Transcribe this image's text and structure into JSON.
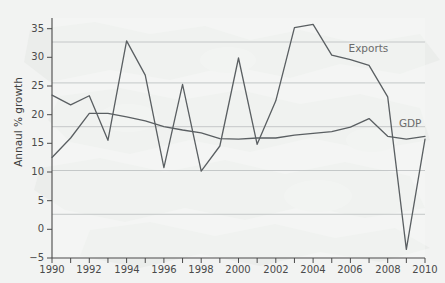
{
  "figure": {
    "background_color": "#f3f4f3",
    "plot_background_color": "#f6f7f6",
    "watermark": "world-map-outline"
  },
  "chart_data": {
    "type": "line",
    "title": "",
    "subtitle": "",
    "xlabel": "",
    "ylabel": "Annaul % growth",
    "xlim": [
      1990,
      2010
    ],
    "ylim": [
      -5,
      37
    ],
    "yticks": [
      -5,
      0,
      5,
      10,
      15,
      20,
      25,
      30,
      35
    ],
    "ytick_labels": [
      "−5",
      "0",
      "5",
      "10",
      "15",
      "20",
      "25",
      "30",
      "35"
    ],
    "xticks": [
      1990,
      1991,
      1992,
      1993,
      1994,
      1995,
      1996,
      1997,
      1998,
      1999,
      2000,
      2001,
      2002,
      2003,
      2004,
      2005,
      2006,
      2007,
      2008,
      2009,
      2010
    ],
    "xtick_labels_shown": [
      "1990",
      "1992",
      "1994",
      "1996",
      "1998",
      "2000",
      "2002",
      "2004",
      "2006",
      "2008",
      "2010"
    ],
    "grid": true,
    "grid_axis": "y",
    "gridline_values": [
      2.5,
      10,
      17.5,
      25,
      32
    ],
    "grid_color": "#b9bcbe",
    "legend_position": "inline-annotations",
    "line_color": "#5a5f62",
    "x": [
      1990,
      1991,
      1992,
      1993,
      1994,
      1995,
      1996,
      1997,
      1998,
      1999,
      2000,
      2001,
      2002,
      2003,
      2004,
      2005,
      2006,
      2007,
      2008,
      2009,
      2010
    ],
    "series": [
      {
        "name": "Exports",
        "color": "#5a5f62",
        "label_position": {
          "x": 2005.9,
          "y": 31.6
        },
        "values": [
          23.5,
          21.8,
          23.4,
          15.6,
          33.0,
          27.0,
          10.8,
          25.4,
          10.2,
          14.6,
          30.0,
          14.9,
          22.5,
          35.3,
          35.9,
          30.5,
          29.7,
          28.7,
          23.2,
          -3.5,
          15.8
        ]
      },
      {
        "name": "GDP",
        "color": "#5a5f62",
        "label_position": {
          "x": 2008.6,
          "y": 18.4
        },
        "values": [
          12.6,
          16.0,
          20.3,
          20.3,
          19.7,
          19.0,
          18.0,
          17.4,
          16.9,
          15.9,
          15.8,
          16.0,
          16.0,
          16.5,
          16.8,
          17.1,
          17.9,
          19.4,
          16.3,
          15.8,
          16.3
        ]
      }
    ]
  }
}
